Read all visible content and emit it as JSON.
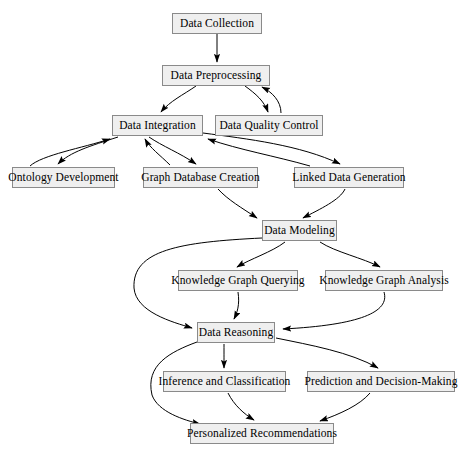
{
  "diagram": {
    "type": "flowchart",
    "background_color": "#ffffff",
    "node_fill_color": "#efefef",
    "node_border_color": "#8a8a8a",
    "edge_color": "#000000",
    "nodes": [
      {
        "id": "data-collection",
        "label": "Data Collection",
        "x": 172,
        "y": 13,
        "w": 90,
        "h": 21
      },
      {
        "id": "data-preprocessing",
        "label": "Data Preprocessing",
        "x": 162,
        "y": 65,
        "w": 108,
        "h": 21
      },
      {
        "id": "data-integration",
        "label": "Data Integration",
        "x": 112,
        "y": 115,
        "w": 91,
        "h": 21
      },
      {
        "id": "data-quality-control",
        "label": "Data Quality Control",
        "x": 215,
        "y": 115,
        "w": 108,
        "h": 21
      },
      {
        "id": "ontology-development",
        "label": "Ontology Development",
        "x": 12,
        "y": 167,
        "w": 103,
        "h": 21
      },
      {
        "id": "graph-database-creation",
        "label": "Graph Database Creation",
        "x": 143,
        "y": 167,
        "w": 115,
        "h": 21
      },
      {
        "id": "linked-data-generation",
        "label": "Linked Data Generation",
        "x": 294,
        "y": 167,
        "w": 110,
        "h": 21
      },
      {
        "id": "data-modeling",
        "label": "Data Modeling",
        "x": 262,
        "y": 220,
        "w": 75,
        "h": 21
      },
      {
        "id": "knowledge-graph-querying",
        "label": "Knowledge Graph Querying",
        "x": 178,
        "y": 270,
        "w": 120,
        "h": 21
      },
      {
        "id": "knowledge-graph-analysis",
        "label": "Knowledge Graph Analysis",
        "x": 325,
        "y": 270,
        "w": 118,
        "h": 21
      },
      {
        "id": "data-reasoning",
        "label": "Data Reasoning",
        "x": 197,
        "y": 322,
        "w": 78,
        "h": 21
      },
      {
        "id": "inference-and-classification",
        "label": "Inference and Classification",
        "x": 163,
        "y": 371,
        "w": 123,
        "h": 21
      },
      {
        "id": "prediction-and-decision-making",
        "label": "Prediction and Decision-Making",
        "x": 307,
        "y": 371,
        "w": 148,
        "h": 21
      },
      {
        "id": "personalized-recommendations",
        "label": "Personalized Recommendations",
        "x": 190,
        "y": 423,
        "w": 144,
        "h": 21
      }
    ],
    "edges": [
      {
        "from": "data-collection",
        "to": "data-preprocessing"
      },
      {
        "from": "data-preprocessing",
        "to": "data-integration"
      },
      {
        "from": "data-preprocessing",
        "to": "data-quality-control"
      },
      {
        "from": "data-quality-control",
        "to": "data-preprocessing"
      },
      {
        "from": "data-integration",
        "to": "ontology-development"
      },
      {
        "from": "data-integration",
        "to": "graph-database-creation"
      },
      {
        "from": "data-integration",
        "to": "linked-data-generation"
      },
      {
        "from": "ontology-development",
        "to": "data-integration"
      },
      {
        "from": "graph-database-creation",
        "to": "data-integration"
      },
      {
        "from": "linked-data-generation",
        "to": "data-integration"
      },
      {
        "from": "graph-database-creation",
        "to": "data-modeling"
      },
      {
        "from": "linked-data-generation",
        "to": "data-modeling"
      },
      {
        "from": "data-modeling",
        "to": "knowledge-graph-querying"
      },
      {
        "from": "data-modeling",
        "to": "knowledge-graph-analysis"
      },
      {
        "from": "data-modeling",
        "to": "data-reasoning"
      },
      {
        "from": "knowledge-graph-querying",
        "to": "data-reasoning"
      },
      {
        "from": "knowledge-graph-analysis",
        "to": "data-reasoning"
      },
      {
        "from": "data-reasoning",
        "to": "inference-and-classification"
      },
      {
        "from": "data-reasoning",
        "to": "prediction-and-decision-making"
      },
      {
        "from": "data-reasoning",
        "to": "personalized-recommendations"
      },
      {
        "from": "inference-and-classification",
        "to": "personalized-recommendations"
      },
      {
        "from": "prediction-and-decision-making",
        "to": "personalized-recommendations"
      }
    ]
  }
}
